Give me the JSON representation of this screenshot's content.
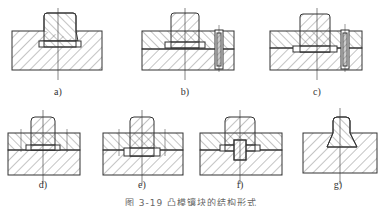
{
  "figure": {
    "caption": "图 3-19  凸模镶块的结构形式",
    "panels": [
      {
        "id": "a",
        "label": "a)",
        "cx": 58
      },
      {
        "id": "b",
        "label": "b)",
        "cx": 185
      },
      {
        "id": "c",
        "label": "c)",
        "cx": 317
      },
      {
        "id": "d",
        "label": "d)",
        "cx": 43
      },
      {
        "id": "e",
        "label": "e)",
        "cx": 142
      },
      {
        "id": "f",
        "label": "f)",
        "cx": 240
      },
      {
        "id": "g",
        "label": "g)",
        "cx": 338
      }
    ]
  },
  "colors": {
    "line": "#333333",
    "hatch": "#555555",
    "background": "#ffffff"
  }
}
